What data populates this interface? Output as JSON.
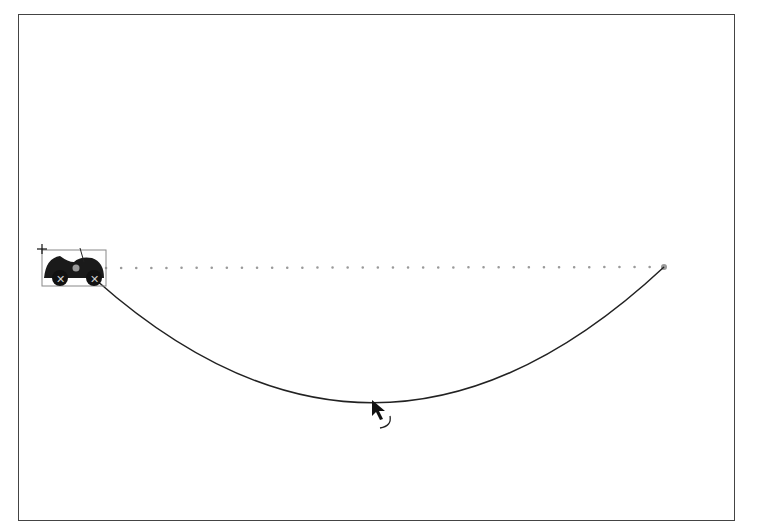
{
  "caption_fragment": "Figure: Dragging a motion path",
  "stage": {
    "background": "#ffffff",
    "border_color": "#444444"
  },
  "sprite": {
    "name": "car",
    "x": 42,
    "y": 250,
    "width": 64,
    "height": 36
  },
  "path": {
    "start": [
      96,
      268
    ],
    "end": [
      664,
      267
    ],
    "guide_style": "dotted",
    "curve_lowest_point": [
      380,
      400
    ]
  },
  "cursor": {
    "type": "rotate-arrow",
    "x": 372,
    "y": 400
  }
}
